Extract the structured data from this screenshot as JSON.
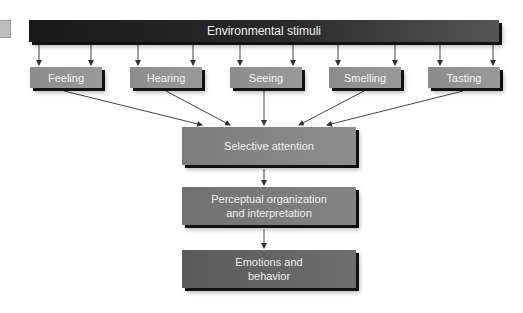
{
  "diagram": {
    "top": {
      "label": "Environmental stimuli"
    },
    "senses": [
      {
        "label": "Feeling"
      },
      {
        "label": "Hearing"
      },
      {
        "label": "Seeing"
      },
      {
        "label": "Smelling"
      },
      {
        "label": "Tasting"
      }
    ],
    "stages": [
      {
        "label": "Selective attention"
      },
      {
        "label_line1": "Perceptual organization",
        "label_line2": "and interpretation"
      },
      {
        "label_line1": "Emotions and",
        "label_line2": "behavior"
      }
    ],
    "colors": {
      "top_bar": "#1e1e1e",
      "sense_box": "#929292",
      "stage_1": "#858585",
      "stage_2": "#7a7a7a",
      "stage_3": "#646464",
      "arrow": "#333333"
    }
  }
}
